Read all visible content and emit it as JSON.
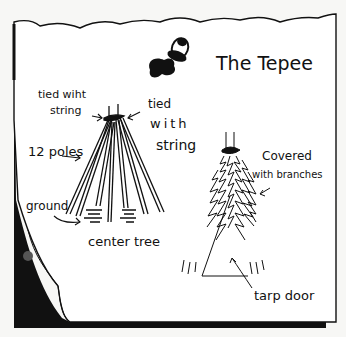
{
  "title": "The Tepee",
  "labels": {
    "tied_left_line1": "tied wiht",
    "tied_left_line2": "string",
    "tied_right_line1": "tied",
    "tied_right_line2": "with",
    "tied_right_line3": "string",
    "poles": "12 poles",
    "ground": "ground",
    "center_tree": "center tree",
    "covered_line1": "Covered",
    "covered_line2": "with branches",
    "tarp_door": "tarp door"
  },
  "icons": {
    "pushpin": "pushpin-icon"
  },
  "colors": {
    "ink": "#111111",
    "paper": "#ffffff",
    "background": "#f7f7f5"
  }
}
